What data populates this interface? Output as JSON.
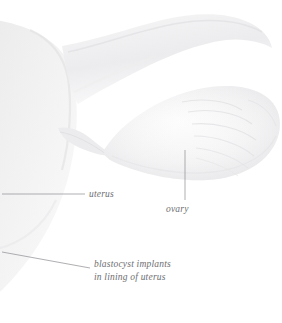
{
  "figure": {
    "background_color": "#ffffff",
    "width": 282,
    "height": 323
  },
  "labels": {
    "uterus": {
      "text": "uterus",
      "color": "#6e6e72",
      "style": "italic",
      "leader_line": "horizontal"
    },
    "ovary": {
      "text": "ovary",
      "color": "#6e6e72",
      "style": "italic",
      "leader_line": "vertical"
    },
    "blastocyst": {
      "line1": "blastocyst implants",
      "line2": "in lining of uterus",
      "color": "#6e6e72",
      "style": "italic",
      "leader_line": "diagonal"
    }
  },
  "structures": {
    "uterus_body": {
      "name": "uterus",
      "fill": "#eeeeef"
    },
    "fallopian_tube": {
      "name": "fallopian tube",
      "fill": "#f2f2f3"
    },
    "ovary": {
      "name": "ovary",
      "fill": "#f6f6f7"
    },
    "fimbriae": {
      "name": "fimbriae",
      "stroke": "#e4e4e6"
    }
  },
  "colors": {
    "line": "#8d8d92",
    "text": "#6e6e72",
    "tissue_light": "#f6f6f7",
    "tissue_mid": "#eeeeef",
    "tissue_shadow": "#e2e2e4"
  }
}
